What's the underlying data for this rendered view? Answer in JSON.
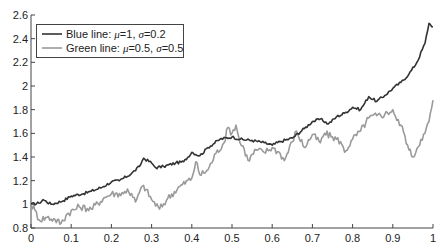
{
  "chart_data": {
    "type": "line",
    "title": "",
    "xlabel": "",
    "ylabel": "",
    "xlim": [
      0,
      1
    ],
    "ylim": [
      0.8,
      2.6
    ],
    "grid": false,
    "legend_position": "upper left",
    "x_ticks": [
      "0",
      "0.1",
      "0.2",
      "0.3",
      "0.4",
      "0.5",
      "0.6",
      "0.7",
      "0.8",
      "0.9",
      "1"
    ],
    "y_ticks": [
      "0.8",
      "1",
      "1.2",
      "1.4",
      "1.6",
      "1.8",
      "2",
      "2.2",
      "2.4",
      "2.6"
    ],
    "series": [
      {
        "name": "Blue line: μ=1, σ=0.2",
        "label_prefix": "Blue line: ",
        "mu": "1",
        "sigma": "0.2",
        "color": "#333333",
        "x": [
          0,
          0.02,
          0.03,
          0.05,
          0.08,
          0.1,
          0.13,
          0.15,
          0.18,
          0.2,
          0.22,
          0.25,
          0.27,
          0.28,
          0.3,
          0.31,
          0.33,
          0.36,
          0.38,
          0.4,
          0.42,
          0.44,
          0.47,
          0.5,
          0.52,
          0.55,
          0.58,
          0.6,
          0.62,
          0.65,
          0.68,
          0.7,
          0.72,
          0.74,
          0.76,
          0.78,
          0.8,
          0.82,
          0.84,
          0.86,
          0.88,
          0.9,
          0.92,
          0.94,
          0.96,
          0.98,
          0.99,
          1.0
        ],
        "values": [
          1.0,
          1.01,
          1.04,
          1.0,
          1.03,
          1.07,
          1.09,
          1.11,
          1.15,
          1.19,
          1.2,
          1.26,
          1.32,
          1.39,
          1.35,
          1.31,
          1.32,
          1.35,
          1.36,
          1.44,
          1.41,
          1.48,
          1.55,
          1.57,
          1.55,
          1.54,
          1.52,
          1.5,
          1.53,
          1.56,
          1.64,
          1.7,
          1.72,
          1.68,
          1.74,
          1.77,
          1.82,
          1.8,
          1.91,
          1.87,
          1.92,
          1.98,
          2.03,
          2.1,
          2.2,
          2.36,
          2.53,
          2.5
        ]
      },
      {
        "name": "Green line: μ=0.5, σ=0.5",
        "label_prefix": "Green line: ",
        "mu": "0.5",
        "sigma": "0.5",
        "color": "#9a9a9a",
        "x": [
          0,
          0.01,
          0.02,
          0.04,
          0.06,
          0.075,
          0.09,
          0.12,
          0.15,
          0.18,
          0.2,
          0.23,
          0.24,
          0.26,
          0.27,
          0.28,
          0.3,
          0.32,
          0.34,
          0.37,
          0.4,
          0.41,
          0.42,
          0.44,
          0.46,
          0.48,
          0.49,
          0.5,
          0.51,
          0.52,
          0.53,
          0.54,
          0.56,
          0.58,
          0.6,
          0.62,
          0.63,
          0.65,
          0.66,
          0.68,
          0.7,
          0.72,
          0.73,
          0.75,
          0.77,
          0.78,
          0.8,
          0.82,
          0.84,
          0.86,
          0.88,
          0.9,
          0.91,
          0.92,
          0.93,
          0.94,
          0.95,
          0.96,
          0.97,
          0.98,
          0.99,
          1.0
        ],
        "values": [
          1.0,
          0.95,
          0.87,
          0.89,
          0.87,
          0.84,
          0.92,
          0.98,
          0.96,
          1.05,
          1.09,
          1.09,
          1.13,
          1.02,
          1.1,
          1.16,
          1.04,
          0.96,
          1.05,
          1.15,
          1.22,
          1.36,
          1.25,
          1.29,
          1.43,
          1.52,
          1.65,
          1.6,
          1.67,
          1.52,
          1.47,
          1.37,
          1.46,
          1.44,
          1.48,
          1.43,
          1.37,
          1.53,
          1.62,
          1.48,
          1.59,
          1.52,
          1.6,
          1.57,
          1.53,
          1.44,
          1.55,
          1.62,
          1.73,
          1.75,
          1.76,
          1.8,
          1.71,
          1.67,
          1.58,
          1.46,
          1.4,
          1.47,
          1.55,
          1.6,
          1.7,
          1.88
        ]
      }
    ]
  },
  "legend": {
    "items": [
      {
        "prefix": "Blue line: ",
        "mu_sym": "μ",
        "mu_val": "=1, ",
        "sigma_sym": "σ",
        "sigma_val": "=0.2",
        "color": "#333333"
      },
      {
        "prefix": "Green line: ",
        "mu_sym": "μ",
        "mu_val": "=0.5, ",
        "sigma_sym": "σ",
        "sigma_val": "=0.5",
        "color": "#9a9a9a"
      }
    ]
  }
}
